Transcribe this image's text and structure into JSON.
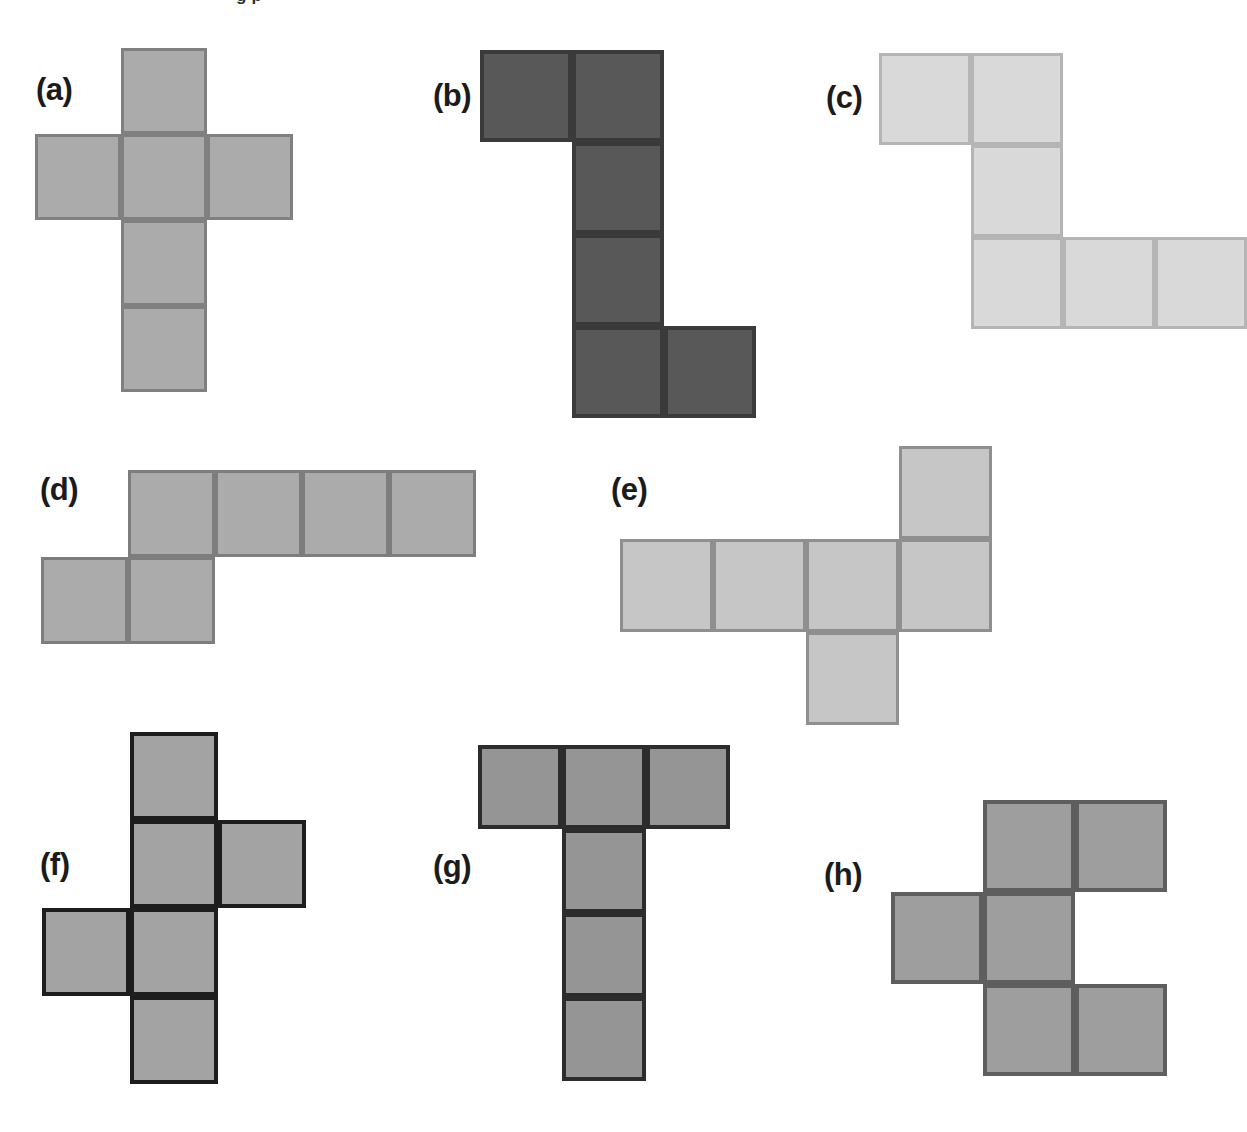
{
  "page": {
    "background": "#ffffff",
    "width": 1214,
    "height": 1132,
    "cropped_header_text": "g p"
  },
  "figures": [
    {
      "id": "a",
      "label": "(a)",
      "label_x": 36,
      "label_y": 74,
      "net_x": 35,
      "net_y": 48,
      "cell": 86,
      "fill": "#ababab",
      "stroke": "#808080",
      "stroke_width": 3,
      "cells": [
        [
          1,
          0
        ],
        [
          0,
          1
        ],
        [
          1,
          1
        ],
        [
          2,
          1
        ],
        [
          1,
          2
        ],
        [
          1,
          3
        ]
      ],
      "cols": 3,
      "rows": 4,
      "shape_name": "plus-cross-net"
    },
    {
      "id": "b",
      "label": "(b)",
      "label_x": 433,
      "label_y": 80,
      "net_x": 480,
      "net_y": 50,
      "cell": 92,
      "fill": "#585858",
      "stroke": "#3a3a3a",
      "stroke_width": 4,
      "cells": [
        [
          0,
          0
        ],
        [
          1,
          0
        ],
        [
          1,
          1
        ],
        [
          1,
          2
        ],
        [
          1,
          3
        ],
        [
          2,
          3
        ]
      ],
      "cols": 3,
      "rows": 4,
      "shape_name": "z-stair-net"
    },
    {
      "id": "c",
      "label": "(c)",
      "label_x": 826,
      "label_y": 82,
      "net_x": 879,
      "net_y": 53,
      "cell": 92,
      "fill": "#d9d9d9",
      "stroke": "#b5b5b5",
      "stroke_width": 3,
      "cells": [
        [
          0,
          0
        ],
        [
          1,
          0
        ],
        [
          1,
          1
        ],
        [
          1,
          2
        ],
        [
          2,
          2
        ],
        [
          3,
          2
        ]
      ],
      "cols": 4,
      "rows": 3,
      "shape_name": "s-zigzag-net"
    },
    {
      "id": "d",
      "label": "(d)",
      "label_x": 40,
      "label_y": 474,
      "net_x": 41,
      "net_y": 470,
      "cell": 87,
      "fill": "#ababab",
      "stroke": "#7d7d7d",
      "stroke_width": 3,
      "cells": [
        [
          1,
          0
        ],
        [
          2,
          0
        ],
        [
          3,
          0
        ],
        [
          4,
          0
        ],
        [
          0,
          1
        ],
        [
          1,
          1
        ]
      ],
      "cols": 5,
      "rows": 2,
      "shape_name": "long-row-with-step-net"
    },
    {
      "id": "e",
      "label": "(e)",
      "label_x": 611,
      "label_y": 474,
      "net_x": 620,
      "net_y": 446,
      "cell": 93,
      "fill": "#c6c6c6",
      "stroke": "#8f8f8f",
      "stroke_width": 3,
      "cells": [
        [
          3,
          0
        ],
        [
          0,
          1
        ],
        [
          1,
          1
        ],
        [
          2,
          1
        ],
        [
          3,
          1
        ],
        [
          2,
          2
        ]
      ],
      "cols": 4,
      "rows": 3,
      "shape_name": "row-with-up-and-down-tabs-net"
    },
    {
      "id": "f",
      "label": "(f)",
      "label_x": 40,
      "label_y": 849,
      "net_x": 42,
      "net_y": 732,
      "cell": 88,
      "fill": "#a3a3a3",
      "stroke": "#1d1d1d",
      "stroke_width": 4,
      "cells": [
        [
          1,
          0
        ],
        [
          1,
          1
        ],
        [
          2,
          1
        ],
        [
          0,
          2
        ],
        [
          1,
          2
        ],
        [
          1,
          3
        ]
      ],
      "cols": 3,
      "rows": 4,
      "shape_name": "dark-outline-cross-net"
    },
    {
      "id": "g",
      "label": "(g)",
      "label_x": 433,
      "label_y": 851,
      "net_x": 478,
      "net_y": 745,
      "cell": 84,
      "fill": "#959595",
      "stroke": "#2c2c2c",
      "stroke_width": 4,
      "cells": [
        [
          0,
          0
        ],
        [
          1,
          0
        ],
        [
          2,
          0
        ],
        [
          1,
          1
        ],
        [
          1,
          2
        ],
        [
          1,
          3
        ]
      ],
      "cols": 3,
      "rows": 4,
      "shape_name": "t-shape-net"
    },
    {
      "id": "h",
      "label": "(h)",
      "label_x": 824,
      "label_y": 859,
      "net_x": 891,
      "net_y": 800,
      "cell": 92,
      "fill": "#9e9e9e",
      "stroke": "#5e5e5e",
      "stroke_width": 4,
      "cells": [
        [
          1,
          0
        ],
        [
          2,
          0
        ],
        [
          0,
          1
        ],
        [
          1,
          1
        ],
        [
          1,
          2
        ],
        [
          2,
          2
        ]
      ],
      "cols": 3,
      "rows": 3,
      "shape_name": "c-stagger-net"
    }
  ]
}
